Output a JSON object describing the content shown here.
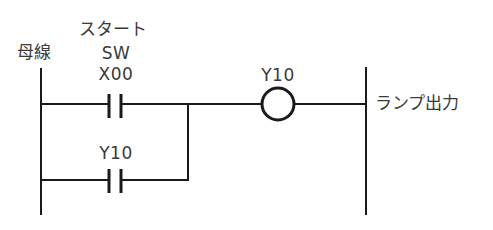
{
  "diagram": {
    "type": "ladder-diagram",
    "line_color": "#1a1a1a",
    "text_color": "#3a3a3a",
    "left_rail": {
      "label": "母線"
    },
    "right_rail": {
      "label": "ランプ出力"
    },
    "rungs": [
      {
        "contact": {
          "type": "normally-open",
          "caption_line1": "スタート",
          "caption_line2": "SW",
          "device": "X00"
        },
        "coil": {
          "device": "Y10"
        }
      },
      {
        "branch_of": 0,
        "contact": {
          "type": "normally-open",
          "device": "Y10"
        }
      }
    ]
  }
}
